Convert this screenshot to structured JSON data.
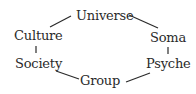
{
  "diagram": {
    "type": "cycle",
    "nodes": [
      {
        "id": "universe",
        "label": "Universe"
      },
      {
        "id": "soma",
        "label": "Soma"
      },
      {
        "id": "psyche",
        "label": "Psyche"
      },
      {
        "id": "group",
        "label": "Group"
      },
      {
        "id": "society",
        "label": "Society"
      },
      {
        "id": "culture",
        "label": "Culture"
      }
    ],
    "edges": [
      {
        "from": "universe",
        "to": "soma"
      },
      {
        "from": "soma",
        "to": "psyche"
      },
      {
        "from": "psyche",
        "to": "group"
      },
      {
        "from": "group",
        "to": "society"
      },
      {
        "from": "society",
        "to": "culture"
      },
      {
        "from": "culture",
        "to": "universe"
      }
    ],
    "colors": {
      "text": "#2a2a2a",
      "line": "#2a2a2a",
      "background": "#ffffff"
    }
  }
}
